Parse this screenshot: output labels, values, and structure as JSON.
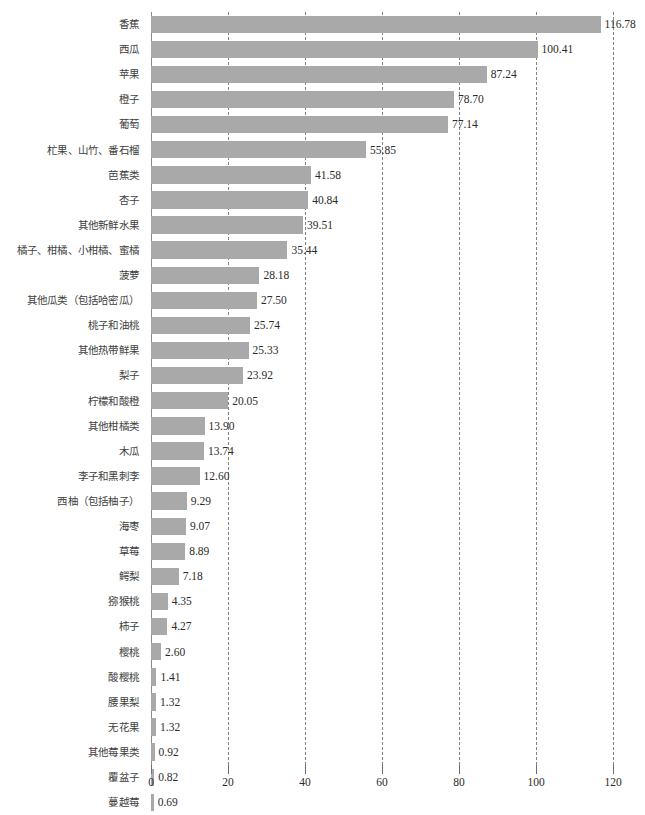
{
  "chart_data": {
    "type": "bar",
    "orientation": "horizontal",
    "title": "",
    "subtitle": "",
    "xlabel": "",
    "ylabel": "",
    "xlim": [
      0,
      120
    ],
    "xticks": [
      0,
      20,
      40,
      60,
      80,
      100,
      120
    ],
    "xtick_labels": [
      "0",
      "20",
      "40",
      "60",
      "80",
      "100",
      "120"
    ],
    "grid": true,
    "grid_axis": "x",
    "legend": false,
    "legend_position": "none",
    "bar_color": "#a9a9a9",
    "value_label_format": "0.00",
    "categories": [
      "香蕉",
      "西瓜",
      "苹果",
      "橙子",
      "葡萄",
      "杧果、山竹、番石榴",
      "芭蕉类",
      "杏子",
      "其他新鲜水果",
      "橘子、柑橘、小柑橘、蜜橘",
      "菠萝",
      "其他瓜类（包括哈密瓜）",
      "桃子和油桃",
      "其他热带鲜果",
      "梨子",
      "柠檬和酸橙",
      "其他柑橘类",
      "木瓜",
      "李子和黑刺李",
      "西柚（包括柚子）",
      "海枣",
      "草莓",
      "鳄梨",
      "猕猴桃",
      "柿子",
      "樱桃",
      "酸樱桃",
      "腰果梨",
      "无花果",
      "其他莓果类",
      "覆盆子",
      "蔓越莓"
    ],
    "values": [
      116.78,
      100.41,
      87.24,
      78.7,
      77.14,
      55.85,
      41.58,
      40.84,
      39.51,
      35.44,
      28.18,
      27.5,
      25.74,
      25.33,
      23.92,
      20.05,
      13.9,
      13.74,
      12.6,
      9.29,
      9.07,
      8.89,
      7.18,
      4.35,
      4.27,
      2.6,
      1.41,
      1.32,
      1.32,
      0.92,
      0.82,
      0.69
    ],
    "value_labels": [
      "116.78",
      "100.41",
      "87.24",
      "78.70",
      "77.14",
      "55.85",
      "41.58",
      "40.84",
      "39.51",
      "35.44",
      "28.18",
      "27.50",
      "25.74",
      "25.33",
      "23.92",
      "20.05",
      "13.90",
      "13.74",
      "12.60",
      "9.29",
      "9.07",
      "8.89",
      "7.18",
      "4.35",
      "4.27",
      "2.60",
      "1.41",
      "1.32",
      "1.32",
      "0.92",
      "0.82",
      "0.69"
    ]
  },
  "colors": {
    "bar": "#a9a9a9",
    "gridline": "#6d6d6d",
    "axis_text": "#2b2b2b",
    "category_text": "#404040",
    "background": "#ffffff"
  }
}
